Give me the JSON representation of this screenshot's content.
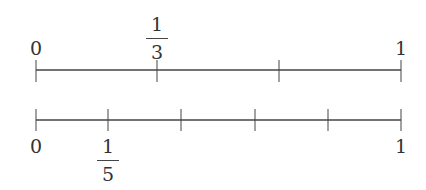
{
  "number_lines": [
    {
      "name": "thirds",
      "divisions": 3,
      "start_label": "0",
      "end_label": "1",
      "fraction_label": {
        "numerator": "1",
        "denominator": "3"
      }
    },
    {
      "name": "fifths",
      "divisions": 5,
      "start_label": "0",
      "end_label": "1",
      "fraction_label": {
        "numerator": "1",
        "denominator": "5"
      }
    }
  ],
  "colors": {
    "line": "#333333",
    "text": "#333333",
    "background": "#ffffff"
  }
}
